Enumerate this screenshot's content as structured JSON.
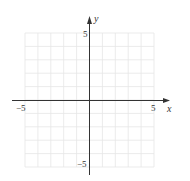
{
  "chart_data": {
    "type": "scatter",
    "title": "",
    "xlabel": "x",
    "ylabel": "y",
    "xlim": [
      -5,
      5
    ],
    "ylim": [
      -5,
      5
    ],
    "grid": true,
    "grid_step": 1,
    "series": [],
    "tick_labels": {
      "x": [
        {
          "value": -5,
          "label": "−5"
        },
        {
          "value": 5,
          "label": "5"
        }
      ],
      "y": [
        {
          "value": 5,
          "label": "5"
        },
        {
          "value": -5,
          "label": "−5"
        }
      ]
    },
    "annotations": []
  },
  "colors": {
    "grid": "#e6e6e6",
    "axis": "#333333",
    "background": "#ffffff"
  }
}
